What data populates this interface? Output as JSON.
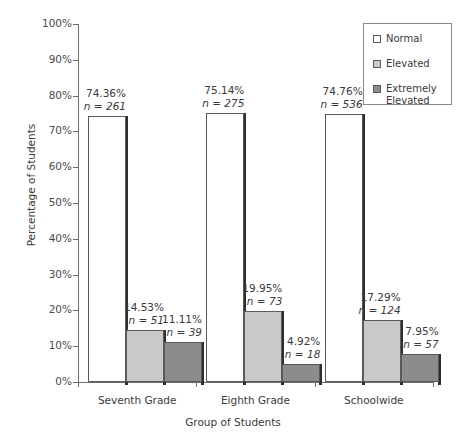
{
  "chart_data": {
    "type": "bar",
    "title": "",
    "xlabel": "Group of Students",
    "ylabel": "Percentage of Students",
    "ylim": [
      0,
      100
    ],
    "ytick_labels": [
      "100%",
      "90%",
      "80%",
      "70%",
      "60%",
      "50%",
      "40%",
      "30%",
      "20%",
      "10%",
      "0%"
    ],
    "ytick_values": [
      100,
      90,
      80,
      70,
      60,
      50,
      40,
      30,
      20,
      10,
      0
    ],
    "grid": false,
    "legend_position": "top-right",
    "categories": [
      "Seventh Grade",
      "Eighth Grade",
      "Schoolwide"
    ],
    "series": [
      {
        "name": "Normal",
        "color": "#ffffff",
        "values": [
          74.36,
          75.14,
          74.76
        ],
        "counts": [
          261,
          275,
          536
        ],
        "value_labels": [
          "74.36%",
          "75.14%",
          "74.76%"
        ],
        "count_labels": [
          "n = 261",
          "n = 275",
          "n = 536"
        ]
      },
      {
        "name": "Elevated",
        "color": "#c9c9c9",
        "values": [
          14.53,
          19.95,
          17.29
        ],
        "counts": [
          51,
          73,
          124
        ],
        "value_labels": [
          "14.53%",
          "19.95%",
          "17.29%"
        ],
        "count_labels": [
          "n = 51",
          "n = 73",
          "n = 124"
        ]
      },
      {
        "name": "Extremely Elevated",
        "color": "#8c8c8c",
        "values": [
          11.11,
          4.92,
          7.95
        ],
        "counts": [
          39,
          18,
          57
        ],
        "value_labels": [
          "11.11%",
          "4.92%",
          "7.95%"
        ],
        "count_labels": [
          "n = 39",
          "n = 18",
          "n = 57"
        ]
      }
    ]
  },
  "legend": {
    "entries": [
      {
        "label": "Normal"
      },
      {
        "label": "Elevated"
      },
      {
        "label": "Extremely Elevated"
      }
    ]
  },
  "axes": {
    "y_title": "Percentage of Students",
    "x_title": "Group of Students",
    "y_ticks": [
      {
        "label": "100%"
      },
      {
        "label": "90%"
      },
      {
        "label": "80%"
      },
      {
        "label": "70%"
      },
      {
        "label": "60%"
      },
      {
        "label": "50%"
      },
      {
        "label": "40%"
      },
      {
        "label": "30%"
      },
      {
        "label": "20%"
      },
      {
        "label": "10%"
      },
      {
        "label": "0%"
      }
    ]
  },
  "groups": [
    {
      "name": "Seventh Grade",
      "bars": [
        {
          "series": "Normal",
          "pct": "74.36%",
          "n": "n = 261"
        },
        {
          "series": "Elevated",
          "pct": "14.53%",
          "n": "n = 51"
        },
        {
          "series": "Extremely Elevated",
          "pct": "11.11%",
          "n": "n = 39"
        }
      ]
    },
    {
      "name": "Eighth Grade",
      "bars": [
        {
          "series": "Normal",
          "pct": "75.14%",
          "n": "n = 275"
        },
        {
          "series": "Elevated",
          "pct": "19.95%",
          "n": "n = 73"
        },
        {
          "series": "Extremely Elevated",
          "pct": "4.92%",
          "n": "n = 18"
        }
      ]
    },
    {
      "name": "Schoolwide",
      "bars": [
        {
          "series": "Normal",
          "pct": "74.76%",
          "n": "n = 536"
        },
        {
          "series": "Elevated",
          "pct": "17.29%",
          "n": "n = 124"
        },
        {
          "series": "Extremely Elevated",
          "pct": "7.95%",
          "n": "n = 57"
        }
      ]
    }
  ]
}
